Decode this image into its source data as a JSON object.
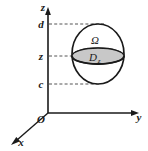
{
  "figure": {
    "background_color": "#ffffff",
    "stroke_color": "#1a1a1a",
    "dashed_color": "#555555",
    "cross_section_fill": "#c8c8c8"
  },
  "axes": {
    "z": {
      "label": "z",
      "x": 48,
      "y": 10
    },
    "y": {
      "label": "y",
      "x": 139,
      "y": 115
    },
    "x": {
      "label": "x",
      "x": 20,
      "y": 142
    },
    "origin": {
      "label": "O",
      "x": 40,
      "y": 119
    }
  },
  "ticks": [
    {
      "name": "upper-bound",
      "label": "d",
      "value_y": 24
    },
    {
      "name": "section-height",
      "label": "z",
      "value_y": 56
    },
    {
      "name": "lower-bound",
      "label": "c",
      "value_y": 84
    }
  ],
  "solid": {
    "label": "Ω",
    "label_x": 95,
    "label_y": 42,
    "center_x": 98,
    "center_y": 54,
    "radius_x": 26,
    "radius_y": 30
  },
  "cross_section": {
    "label": "D",
    "subscript": "z",
    "label_x": 94,
    "label_y": 62,
    "center_x": 98,
    "center_y": 56,
    "radius_x": 26,
    "radius_y": 8
  },
  "dashed_lines": [
    {
      "name": "dashed-d",
      "from_x": 48,
      "to_x": 105,
      "y": 24
    },
    {
      "name": "dashed-z",
      "from_x": 48,
      "to_x": 76,
      "y": 56
    },
    {
      "name": "dashed-c",
      "from_x": 48,
      "to_x": 100,
      "y": 84
    }
  ]
}
